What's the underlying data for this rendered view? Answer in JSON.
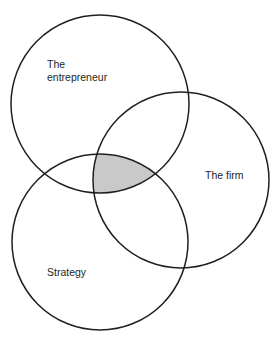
{
  "diagram": {
    "type": "venn",
    "title": "",
    "background_color": "#ffffff",
    "stroke_color": "#231f20",
    "stroke_width": 1.5,
    "text_color": "#231f20",
    "intersection_fill": "#c9c9c9",
    "circles": [
      {
        "id": "entrepreneur",
        "label": "The entrepreneur",
        "label_lines": [
          "The",
          "entrepreneur"
        ],
        "cx": 100,
        "cy": 104,
        "r": 89,
        "label_x": 47,
        "label_y": 68,
        "fill": "none"
      },
      {
        "id": "firm",
        "label": "The firm",
        "label_lines": [
          "The firm"
        ],
        "cx": 181,
        "cy": 180,
        "r": 88,
        "label_x": 205,
        "label_y": 179,
        "fill": "none"
      },
      {
        "id": "strategy",
        "label": "Strategy",
        "label_lines": [
          "Strategy"
        ],
        "cx": 100,
        "cy": 242,
        "r": 88,
        "label_x": 47,
        "label_y": 276,
        "fill": "none"
      }
    ],
    "shaded_regions": [
      {
        "id": "triple-intersection",
        "members": [
          "entrepreneur",
          "firm",
          "strategy"
        ],
        "fill": "#c9c9c9",
        "label": ""
      }
    ]
  }
}
